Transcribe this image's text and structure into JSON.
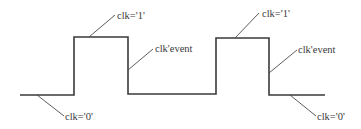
{
  "diagram": {
    "type": "clock-waveform",
    "signal": "clk",
    "colors": {
      "waveform": "#3a3a3a",
      "leader": "#4a4a4a",
      "text": "#3a3a3a",
      "background": "#ffffff"
    },
    "waveform_points": [
      [
        20,
        95
      ],
      [
        74,
        95
      ],
      [
        74,
        37
      ],
      [
        128,
        37
      ],
      [
        128,
        94
      ],
      [
        216,
        94
      ],
      [
        216,
        38
      ],
      [
        269,
        38
      ],
      [
        269,
        95
      ],
      [
        325,
        95
      ]
    ],
    "annotations": [
      {
        "id": "low-1",
        "text": "clk='0'",
        "leader": [
          37,
          95,
          64,
          116
        ],
        "pos": [
          65,
          120
        ]
      },
      {
        "id": "high-1",
        "text": "clk='1'",
        "leader": [
          89,
          37,
          115,
          15
        ],
        "pos": [
          117,
          19
        ]
      },
      {
        "id": "event-1",
        "text": "clk'event",
        "leader": [
          128,
          70,
          153,
          49
        ],
        "pos": [
          155,
          52
        ]
      },
      {
        "id": "high-2",
        "text": "clk='1'",
        "leader": [
          235,
          38,
          259,
          13
        ],
        "pos": [
          262,
          17
        ]
      },
      {
        "id": "event-2",
        "text": "clk'event",
        "leader": [
          269,
          73,
          297,
          50
        ],
        "pos": [
          298,
          53
        ]
      },
      {
        "id": "low-2",
        "text": "clk='0'",
        "leader": [
          290,
          95,
          316,
          116
        ],
        "pos": [
          317,
          120
        ]
      }
    ]
  }
}
